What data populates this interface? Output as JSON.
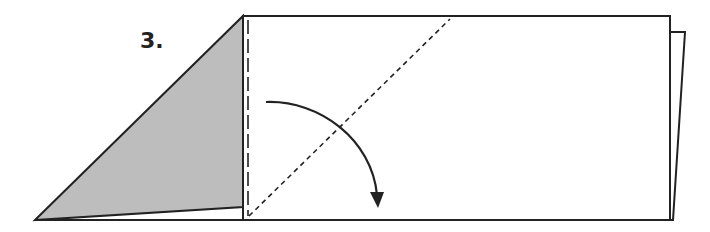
{
  "step": {
    "label": "3."
  },
  "colors": {
    "line": "#222222",
    "shade": "#bdbdbd",
    "paper": "#ffffff"
  }
}
